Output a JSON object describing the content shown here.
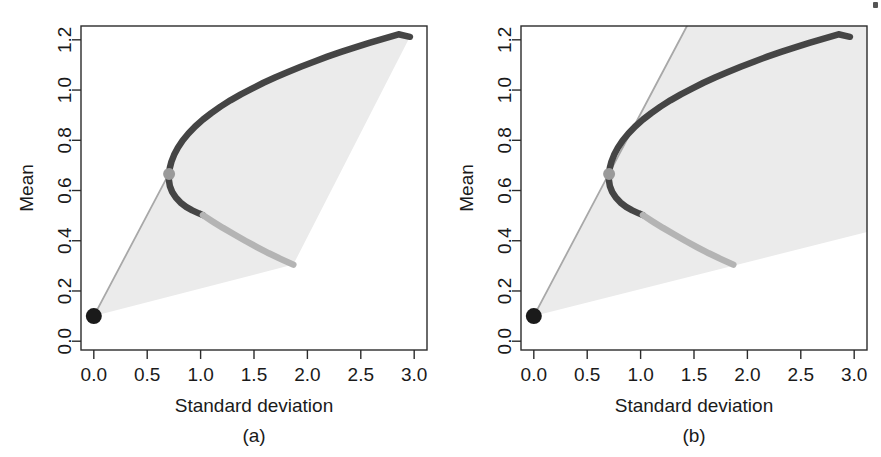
{
  "figure": {
    "background_color": "#ffffff",
    "panel_count": 2,
    "corner_artifact": ""
  },
  "chart_data": [
    {
      "type": "line",
      "panel": "a",
      "caption": "(a)",
      "title": "",
      "xlabel": "Standard deviation",
      "ylabel": "Mean",
      "xlim": [
        -0.12,
        3.12
      ],
      "ylim": [
        -0.035,
        1.255
      ],
      "xticks": [
        0.0,
        0.5,
        1.0,
        1.5,
        2.0,
        2.5,
        3.0
      ],
      "xtick_labels": [
        "0.0",
        "0.5",
        "1.0",
        "1.5",
        "2.0",
        "2.5",
        "3.0"
      ],
      "yticks": [
        0.0,
        0.2,
        0.4,
        0.6,
        0.8,
        1.0,
        1.2
      ],
      "ytick_labels": [
        "0.0",
        "0.2",
        "0.4",
        "0.6",
        "0.8",
        "1.0",
        "1.2"
      ],
      "grid": false,
      "legend": "none",
      "series": [
        {
          "name": "efficient-frontier-upper",
          "role": "efficient frontier (upper branch)",
          "color": "#454545",
          "width": 6.5,
          "points": [
            [
              0.705,
              0.668
            ],
            [
              0.712,
              0.69
            ],
            [
              0.727,
              0.715
            ],
            [
              0.752,
              0.742
            ],
            [
              0.787,
              0.77
            ],
            [
              0.832,
              0.799
            ],
            [
              0.886,
              0.827
            ],
            [
              0.949,
              0.855
            ],
            [
              1.021,
              0.882
            ],
            [
              1.1,
              0.908
            ],
            [
              1.186,
              0.934
            ],
            [
              1.279,
              0.959
            ],
            [
              1.377,
              0.983
            ],
            [
              1.481,
              1.006
            ],
            [
              1.589,
              1.029
            ],
            [
              1.702,
              1.051
            ],
            [
              1.818,
              1.072
            ],
            [
              1.938,
              1.093
            ],
            [
              2.061,
              1.113
            ],
            [
              2.187,
              1.133
            ],
            [
              2.316,
              1.152
            ],
            [
              2.447,
              1.17
            ],
            [
              2.58,
              1.188
            ],
            [
              2.716,
              1.205
            ],
            [
              2.853,
              1.222
            ],
            [
              2.96,
              1.212
            ]
          ]
        },
        {
          "name": "frontier-lower-dark",
          "role": "inefficient frontier segment (dark)",
          "color": "#454545",
          "width": 6.5,
          "points": [
            [
              0.705,
              0.663
            ],
            [
              0.703,
              0.643
            ],
            [
              0.712,
              0.618
            ],
            [
              0.734,
              0.594
            ],
            [
              0.768,
              0.572
            ],
            [
              0.812,
              0.552
            ],
            [
              0.864,
              0.535
            ],
            [
              0.922,
              0.521
            ],
            [
              0.983,
              0.509
            ],
            [
              1.022,
              0.502
            ]
          ]
        },
        {
          "name": "frontier-lower-light",
          "role": "inefficient frontier segment (light)",
          "color": "#b4b4b4",
          "width": 6.5,
          "points": [
            [
              1.022,
              0.502
            ],
            [
              1.112,
              0.477
            ],
            [
              1.21,
              0.451
            ],
            [
              1.312,
              0.426
            ],
            [
              1.418,
              0.4
            ],
            [
              1.527,
              0.375
            ],
            [
              1.639,
              0.35
            ],
            [
              1.753,
              0.327
            ],
            [
              1.868,
              0.305
            ]
          ]
        },
        {
          "name": "capital-market-line",
          "role": "tangent line from risk-free asset",
          "color": "#a8a8a8",
          "width": 1.8,
          "points": [
            [
              0.0,
              0.1
            ],
            [
              0.705,
              0.668
            ]
          ]
        },
        {
          "name": "capital-market-line-extension",
          "role": "tangent line extension beyond tangency point",
          "color": "#a8a8a8",
          "width": 1.8,
          "points": []
        }
      ],
      "markers": [
        {
          "name": "risk-free-asset",
          "x": 0.0,
          "y": 0.1,
          "color": "#1a1a1a",
          "radius": 8
        },
        {
          "name": "tangency-portfolio",
          "x": 0.705,
          "y": 0.666,
          "color": "#9a9a9a",
          "radius": 6
        }
      ],
      "shaded_regions": [
        {
          "name": "attainable-set-a",
          "color": "#ebebeb",
          "polygon": [
            [
              0.0,
              0.1
            ],
            [
              0.705,
              0.668
            ],
            [
              0.712,
              0.69
            ],
            [
              0.727,
              0.715
            ],
            [
              0.752,
              0.742
            ],
            [
              0.787,
              0.77
            ],
            [
              0.832,
              0.799
            ],
            [
              0.886,
              0.827
            ],
            [
              0.949,
              0.855
            ],
            [
              1.021,
              0.882
            ],
            [
              1.1,
              0.908
            ],
            [
              1.186,
              0.934
            ],
            [
              1.279,
              0.959
            ],
            [
              1.377,
              0.983
            ],
            [
              1.481,
              1.006
            ],
            [
              1.589,
              1.029
            ],
            [
              1.702,
              1.051
            ],
            [
              1.818,
              1.072
            ],
            [
              1.938,
              1.093
            ],
            [
              2.061,
              1.113
            ],
            [
              2.187,
              1.133
            ],
            [
              2.316,
              1.152
            ],
            [
              2.447,
              1.17
            ],
            [
              2.58,
              1.188
            ],
            [
              2.716,
              1.205
            ],
            [
              2.853,
              1.222
            ],
            [
              2.96,
              1.212
            ],
            [
              1.868,
              0.305
            ]
          ]
        }
      ]
    },
    {
      "type": "line",
      "panel": "b",
      "caption": "(b)",
      "title": "",
      "xlabel": "Standard deviation",
      "ylabel": "Mean",
      "xlim": [
        -0.12,
        3.12
      ],
      "ylim": [
        -0.035,
        1.255
      ],
      "xticks": [
        0.0,
        0.5,
        1.0,
        1.5,
        2.0,
        2.5,
        3.0
      ],
      "xtick_labels": [
        "0.0",
        "0.5",
        "1.0",
        "1.5",
        "2.0",
        "2.5",
        "3.0"
      ],
      "yticks": [
        0.0,
        0.2,
        0.4,
        0.6,
        0.8,
        1.0,
        1.2
      ],
      "ytick_labels": [
        "0.0",
        "0.2",
        "0.4",
        "0.6",
        "0.8",
        "1.0",
        "1.2"
      ],
      "grid": false,
      "legend": "none",
      "series": [
        {
          "name": "efficient-frontier-upper",
          "role": "efficient frontier (upper branch)",
          "color": "#454545",
          "width": 6.5,
          "points": [
            [
              0.705,
              0.668
            ],
            [
              0.712,
              0.69
            ],
            [
              0.727,
              0.715
            ],
            [
              0.752,
              0.742
            ],
            [
              0.787,
              0.77
            ],
            [
              0.832,
              0.799
            ],
            [
              0.886,
              0.827
            ],
            [
              0.949,
              0.855
            ],
            [
              1.021,
              0.882
            ],
            [
              1.1,
              0.908
            ],
            [
              1.186,
              0.934
            ],
            [
              1.279,
              0.959
            ],
            [
              1.377,
              0.983
            ],
            [
              1.481,
              1.006
            ],
            [
              1.589,
              1.029
            ],
            [
              1.702,
              1.051
            ],
            [
              1.818,
              1.072
            ],
            [
              1.938,
              1.093
            ],
            [
              2.061,
              1.113
            ],
            [
              2.187,
              1.133
            ],
            [
              2.316,
              1.152
            ],
            [
              2.447,
              1.17
            ],
            [
              2.58,
              1.188
            ],
            [
              2.716,
              1.205
            ],
            [
              2.853,
              1.222
            ],
            [
              2.96,
              1.212
            ]
          ]
        },
        {
          "name": "frontier-lower-dark",
          "role": "inefficient frontier segment (dark)",
          "color": "#454545",
          "width": 6.5,
          "points": [
            [
              0.705,
              0.663
            ],
            [
              0.703,
              0.643
            ],
            [
              0.712,
              0.618
            ],
            [
              0.734,
              0.594
            ],
            [
              0.768,
              0.572
            ],
            [
              0.812,
              0.552
            ],
            [
              0.864,
              0.535
            ],
            [
              0.922,
              0.521
            ],
            [
              0.983,
              0.509
            ],
            [
              1.022,
              0.502
            ]
          ]
        },
        {
          "name": "frontier-lower-light",
          "role": "inefficient frontier segment (light)",
          "color": "#b4b4b4",
          "width": 6.5,
          "points": [
            [
              1.022,
              0.502
            ],
            [
              1.112,
              0.477
            ],
            [
              1.21,
              0.451
            ],
            [
              1.312,
              0.426
            ],
            [
              1.418,
              0.4
            ],
            [
              1.527,
              0.375
            ],
            [
              1.639,
              0.35
            ],
            [
              1.753,
              0.327
            ],
            [
              1.868,
              0.305
            ]
          ]
        },
        {
          "name": "capital-market-line",
          "role": "tangent line from risk-free asset",
          "color": "#a8a8a8",
          "width": 1.8,
          "points": [
            [
              0.0,
              0.1
            ],
            [
              0.705,
              0.668
            ]
          ]
        },
        {
          "name": "capital-market-line-extension",
          "role": "tangent line extension beyond tangency point",
          "color": "#a8a8a8",
          "width": 1.8,
          "points": [
            [
              0.705,
              0.668
            ],
            [
              1.142,
              1.02
            ],
            [
              1.434,
              1.255
            ]
          ]
        }
      ],
      "markers": [
        {
          "name": "risk-free-asset",
          "x": 0.0,
          "y": 0.1,
          "color": "#1a1a1a",
          "radius": 8
        },
        {
          "name": "tangency-portfolio",
          "x": 0.705,
          "y": 0.666,
          "color": "#9a9a9a",
          "radius": 6
        }
      ],
      "shaded_regions": [
        {
          "name": "attainable-set-b-cone",
          "color": "#ebebeb",
          "polygon": [
            [
              0.0,
              0.1
            ],
            [
              1.434,
              1.255
            ],
            [
              3.12,
              1.255
            ],
            [
              3.12,
              0.435
            ]
          ]
        }
      ]
    }
  ]
}
